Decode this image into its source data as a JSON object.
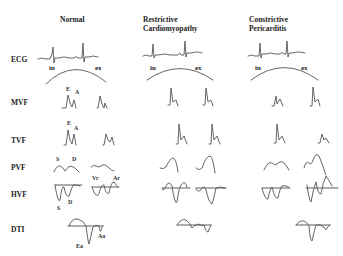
{
  "columns": [
    {
      "title": "Normal"
    },
    {
      "title_line1": "Restrictive",
      "title_line2": "Cardiomyopathy"
    },
    {
      "title_line1": "Constrictive",
      "title_line2": "Pericarditis"
    }
  ],
  "rows": [
    {
      "label": "ECG"
    },
    {
      "label": "MVF"
    },
    {
      "label": "TVF"
    },
    {
      "label": "PVF"
    },
    {
      "label": "HVF"
    },
    {
      "label": "DTI"
    }
  ],
  "respiration": {
    "inspiration": "in",
    "expiration": "ex"
  },
  "annotations": {
    "mvf_e": "E",
    "mvf_a": "A",
    "tvf_e": "E",
    "tvf_a": "A",
    "pvf_s": "S",
    "pvf_d": "D",
    "hvf_s": "S",
    "hvf_d": "D",
    "hvf_vr": "Vr",
    "hvf_ar": "Ar",
    "dti_ea": "Ea",
    "dti_aa": "Aa"
  }
}
